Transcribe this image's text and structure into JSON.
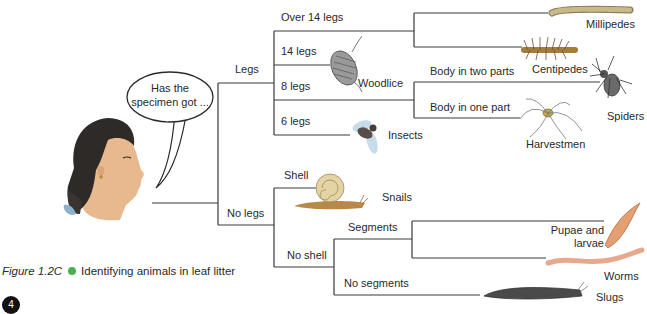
{
  "question": {
    "line1": "Has the",
    "line2": "specimen got ..."
  },
  "branches": {
    "legs": "Legs",
    "no_legs": "No legs",
    "over14": "Over 14 legs",
    "legs14": "14 legs",
    "legs8": "8 legs",
    "legs6": "6 legs",
    "body_two": "Body in two parts",
    "body_one": "Body in one part",
    "shell": "Shell",
    "no_shell": "No shell",
    "segments": "Segments",
    "no_segments": "No segments"
  },
  "animals": {
    "millipedes": "Millipedes",
    "centipedes": "Centipedes",
    "woodlice": "Woodlice",
    "spiders": "Spiders",
    "harvestmen": "Harvestmen",
    "insects": "Insects",
    "snails": "Snails",
    "pupae1": "Pupae and",
    "pupae2": "larvae",
    "worms": "Worms",
    "slugs": "Slugs"
  },
  "caption": {
    "figure": "Figure 1.2C",
    "text": "Identifying animals in leaf litter",
    "bullet_color": "#4cb050"
  },
  "page_number": "4"
}
